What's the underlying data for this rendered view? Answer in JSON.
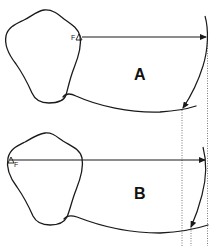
{
  "panels": [
    {
      "id": "A",
      "label": "A",
      "point_label": "F"
    },
    {
      "id": "B",
      "label": "B",
      "point_label": "F"
    }
  ],
  "colors": {
    "stroke": "#1a1a1a",
    "dotted": "#555555",
    "background": "#ffffff"
  }
}
